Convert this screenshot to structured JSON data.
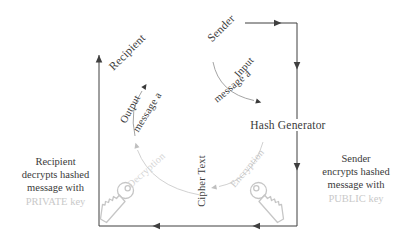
{
  "diagram": {
    "nodes": {
      "sender": "Sender",
      "recipient": "Recipient",
      "hash_generator": "Hash Generator",
      "cipher_text": "Cipher Text"
    },
    "flows": {
      "input_line1": "Input",
      "input_line2": "message a",
      "output_line1": "Output",
      "output_line2": "message a",
      "encryption": "Encryption",
      "decryption": "Decryption"
    },
    "notes": {
      "left": {
        "line1": "Recipient",
        "line2": "decrypts hashed",
        "line3": "message with",
        "key_line": "PRIVATE key"
      },
      "right": {
        "line1": "Sender",
        "line2": "encrypts hashed",
        "line3": "message with",
        "key_line": "PUBLIC key"
      }
    },
    "icons": {
      "left_key": "key-icon",
      "right_key": "key-icon"
    },
    "colors": {
      "ink": "#3a3a3a",
      "flow_gray": "#9a9a9a",
      "light_gray": "#c6c6c6",
      "background": "#ffffff"
    }
  }
}
